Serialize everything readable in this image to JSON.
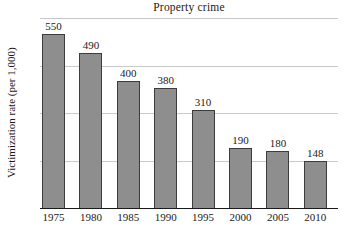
{
  "chart_data": {
    "type": "bar",
    "title": "Property crime",
    "ylabel": "Victimization rate (per 1,000)",
    "xlabel": "",
    "categories": [
      "1975",
      "1980",
      "1985",
      "1990",
      "1995",
      "2000",
      "2005",
      "2010"
    ],
    "values": [
      550,
      490,
      400,
      380,
      310,
      190,
      180,
      148
    ],
    "bar_labels": [
      "550",
      "490",
      "400",
      "380",
      "310",
      "190",
      "180",
      "148"
    ],
    "ylim": [
      0,
      600
    ],
    "gridlines": [
      150,
      300,
      450,
      600
    ],
    "grid": true,
    "legend_position": "none",
    "y_tick_labels_shown": false
  },
  "colors": {
    "background": "#ffffff",
    "bar_fill": "#8e8e8e",
    "bar_border": "#3c3c3c",
    "gridline": "#c9c9c9",
    "axis": "#1a1a1a",
    "text": "#1a1a1a"
  }
}
